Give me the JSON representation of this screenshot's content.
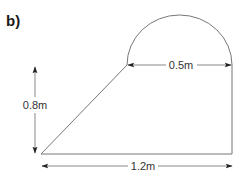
{
  "figure": {
    "part_label": "b)",
    "shape": "trapezium with semicircle on top edge",
    "dimensions": {
      "height": "0.8m",
      "diameter": "0.5m",
      "base": "1.2m"
    }
  },
  "colors": {
    "shape_stroke": "#777777",
    "arrow": "#222222",
    "text": "#333333"
  }
}
